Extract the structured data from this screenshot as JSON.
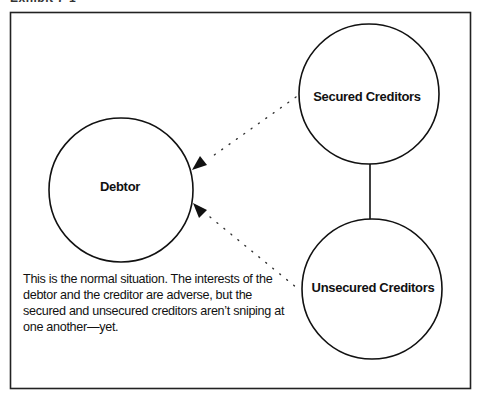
{
  "exhibit": {
    "caption": "Exhibit 7-1"
  },
  "nodes": [
    {
      "id": "debtor",
      "label": "Debtor"
    },
    {
      "id": "secured",
      "label": "Secured Creditors"
    },
    {
      "id": "unsecured",
      "label": "Unsecured Creditors"
    }
  ],
  "edges": [
    {
      "from": "secured",
      "to": "debtor",
      "style": "dotted-arrow"
    },
    {
      "from": "unsecured",
      "to": "debtor",
      "style": "dotted-arrow"
    },
    {
      "from": "secured",
      "to": "unsecured",
      "style": "solid-line"
    }
  ],
  "note": "This is the normal situation. The interests of the debtor and the creditor are adverse, but the secured and unsecured creditors aren’t sniping at one another—yet."
}
